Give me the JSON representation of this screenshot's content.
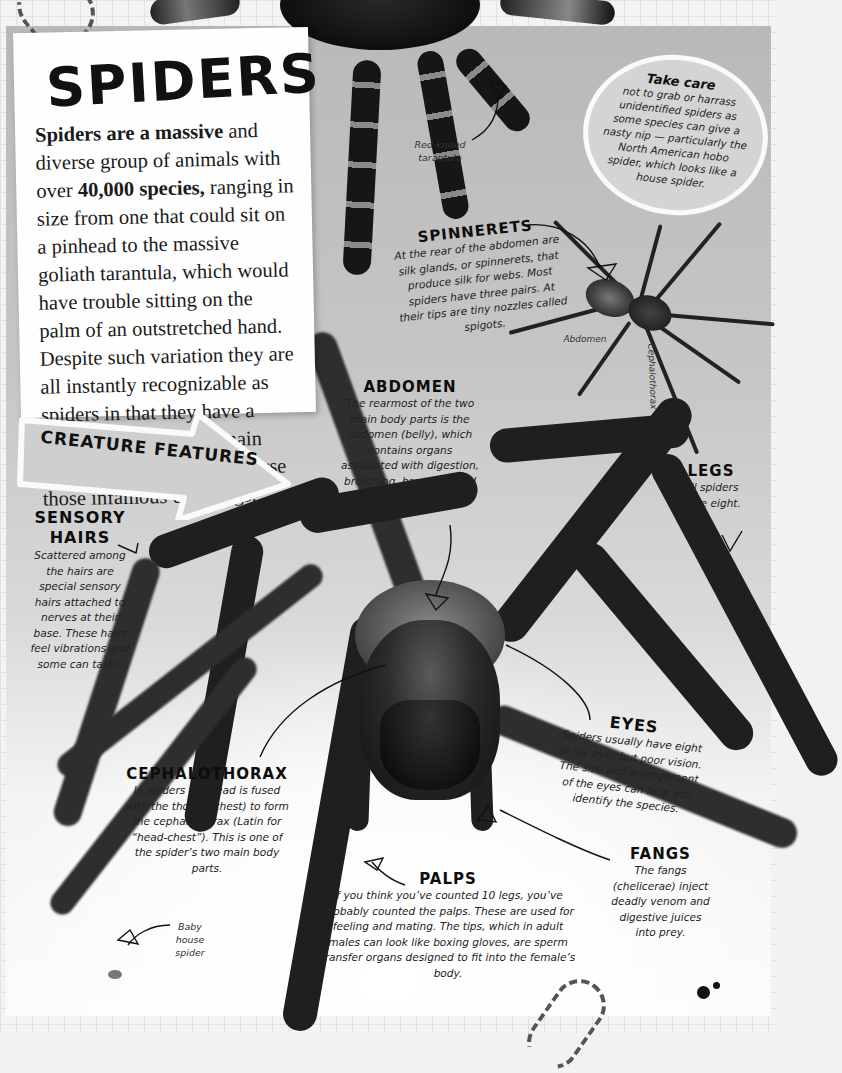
{
  "page": {
    "title": "SPIDERS",
    "intro": {
      "bold_lead": "Spiders are a massive",
      "text_1": " and diverse group of animals with over ",
      "bold_species": "40,000 species,",
      "text_2": " ranging in size from one that could sit on a pinhead to the massive goliath tarantula, which would have trouble sitting on the palm of an outstretched hand. Despite such variation they are all instantly recognizable as spiders in that they have a body made up of two main parts (see right) and of course those infamous eight legs."
    },
    "section_banner": "CREATURE FEATURES",
    "take_care": {
      "heading": "Take care",
      "text": "not to grab or harrass unidentified spiders as some species can give a nasty nip — particularly the North American hobo spider, which looks like a house spider."
    },
    "photo_captions": {
      "tarantula": "Red-kneed tarantula",
      "small_abdomen": "Abdomen",
      "small_cephalothorax": "Cephalothorax",
      "baby": "Baby house spider"
    },
    "features": [
      {
        "id": "spinnerets",
        "heading": "SPINNERETS",
        "text": "At the rear of the abdomen are silk glands, or spinnerets, that produce silk for webs. Most spiders have three pairs. At their tips are tiny nozzles called spigots."
      },
      {
        "id": "abdomen",
        "heading": "ABDOMEN",
        "text": "The rearmost of the two main body parts is the abdomen (belly), which contains organs associated with digestion, breathing, breeding, and silk production."
      },
      {
        "id": "legs",
        "heading": "LEGS",
        "text": "All spiders have eight."
      },
      {
        "id": "sensory-hairs",
        "heading": "SENSORY HAIRS",
        "text": "Scattered among the hairs are special sensory hairs attached to nerves at their base. These hairs feel vibrations and some can taste."
      },
      {
        "id": "eyes",
        "heading": "EYES",
        "text": "Spiders usually have eight or six eyes but poor vision. The size and arrangement of the eyes can help you identify the species."
      },
      {
        "id": "cephalothorax",
        "heading": "CEPHALOTHORAX",
        "text": "In spiders the head is fused with the thorax (chest) to form the cephalothorax (Latin for “head-chest”). This is one of the spider’s two main body parts."
      },
      {
        "id": "fangs",
        "heading": "FANGS",
        "text": "The fangs (chelicerae) inject deadly venom and digestive juices into prey."
      },
      {
        "id": "palps",
        "heading": "PALPS",
        "text": "If you think you’ve counted 10 legs, you’ve probably counted the palps. These are used for feeling and mating. The tips, which in adult males can look like boxing gloves, are sperm transfer organs designed to fit into the female’s body."
      }
    ],
    "colors": {
      "ink": "#111111",
      "paper": "#fefefe",
      "background_grey": "#c6c6c6",
      "grid": "#e2e2e2"
    }
  }
}
